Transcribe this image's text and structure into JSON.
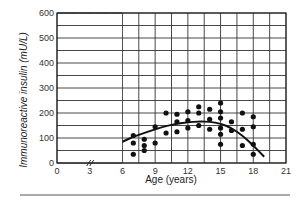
{
  "chart_data": {
    "type": "scatter",
    "title": "",
    "xlabel": "Age (years)",
    "ylabel": "Immunoreactive insulin (mU/L)",
    "xlim": [
      0,
      21
    ],
    "ylim": [
      0,
      600
    ],
    "x_ticks": [
      0,
      3,
      6,
      9,
      12,
      15,
      18,
      21
    ],
    "y_ticks": [
      0,
      100,
      200,
      300,
      400,
      500,
      600
    ],
    "grid": true,
    "grid_x_step": 1.5,
    "grid_y_step": 50,
    "axis_break": {
      "axis": "x",
      "at": 3
    },
    "series": [
      {
        "name": "Insulin measurements",
        "kind": "points",
        "points": [
          [
            7,
            110
          ],
          [
            7,
            80
          ],
          [
            7,
            35
          ],
          [
            8,
            95
          ],
          [
            8,
            70
          ],
          [
            8,
            50
          ],
          [
            9,
            145
          ],
          [
            9,
            80
          ],
          [
            10,
            200
          ],
          [
            10,
            120
          ],
          [
            11,
            195
          ],
          [
            11,
            165
          ],
          [
            11,
            125
          ],
          [
            12,
            205
          ],
          [
            12,
            170
          ],
          [
            12,
            140
          ],
          [
            13,
            225
          ],
          [
            13,
            200
          ],
          [
            13,
            150
          ],
          [
            14,
            215
          ],
          [
            14,
            175
          ],
          [
            14,
            135
          ],
          [
            15,
            240
          ],
          [
            15,
            205
          ],
          [
            15,
            180
          ],
          [
            15,
            140
          ],
          [
            15,
            115
          ],
          [
            15,
            75
          ],
          [
            16,
            165
          ],
          [
            16,
            130
          ],
          [
            17,
            200
          ],
          [
            17,
            135
          ],
          [
            17,
            70
          ],
          [
            18,
            185
          ],
          [
            18,
            145
          ],
          [
            18,
            75
          ],
          [
            18,
            35
          ]
        ]
      },
      {
        "name": "Fitted curve",
        "kind": "line",
        "points": [
          [
            6,
            85
          ],
          [
            7,
            105
          ],
          [
            8,
            120
          ],
          [
            9,
            135
          ],
          [
            10,
            148
          ],
          [
            11,
            157
          ],
          [
            12,
            163
          ],
          [
            13,
            166
          ],
          [
            14,
            165
          ],
          [
            15,
            158
          ],
          [
            16,
            140
          ],
          [
            17,
            110
          ],
          [
            18,
            70
          ],
          [
            19,
            25
          ]
        ]
      }
    ]
  },
  "labels": {
    "xlabel": "Age (years)",
    "ylabel": "Immunoreactive insulin (mU/L)"
  }
}
